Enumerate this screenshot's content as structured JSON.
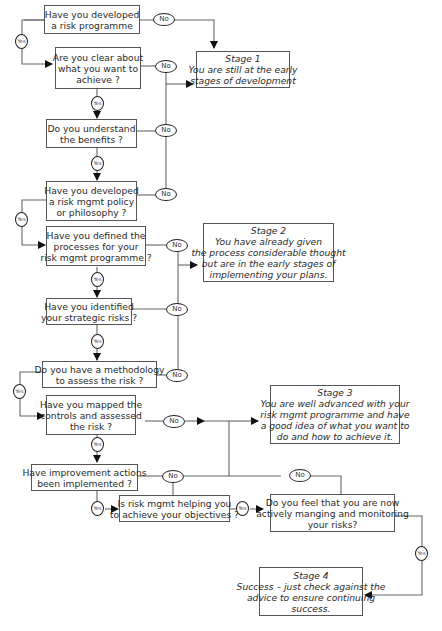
{
  "diagram": {
    "labels": {
      "yes": "Yes",
      "no": "No"
    },
    "questions": [
      {
        "id": "q1",
        "lines": [
          "Have you developed",
          "a risk programme"
        ]
      },
      {
        "id": "q2",
        "lines": [
          "Are you clear about",
          "what you want to",
          "achieve ?"
        ]
      },
      {
        "id": "q3",
        "lines": [
          "Do you understand",
          "the benefits ?"
        ]
      },
      {
        "id": "q4",
        "lines": [
          "Have you developed",
          "a risk mgmt policy",
          "or philosophy ?"
        ]
      },
      {
        "id": "q5",
        "lines": [
          "Have you defined the",
          "processes for your",
          "risk mgmt programme ?"
        ]
      },
      {
        "id": "q6",
        "lines": [
          "Have you identified",
          "your strategic risks ?"
        ]
      },
      {
        "id": "q7",
        "lines": [
          "Do you have a methodology",
          "to assess the risk ?"
        ]
      },
      {
        "id": "q8",
        "lines": [
          "Have you mapped the",
          "controls and assessed",
          "the risk ?"
        ]
      },
      {
        "id": "q9",
        "lines": [
          "Have improvement actions",
          "been implemented ?"
        ]
      },
      {
        "id": "q10",
        "lines": [
          "Is risk mgmt helping you",
          "to achieve your objectives ?"
        ]
      },
      {
        "id": "q11",
        "lines": [
          "Do you feel that you are now",
          "actively manging and monitoring",
          "your risks?"
        ]
      }
    ],
    "stages": [
      {
        "id": "s1",
        "lines": [
          "Stage 1",
          "You are still at the early",
          "stages of development"
        ]
      },
      {
        "id": "s2",
        "lines": [
          "Stage 2",
          "You have already given",
          "the process considerable thought",
          "but are in the early stages of",
          "implementing your plans."
        ]
      },
      {
        "id": "s3",
        "lines": [
          "Stage 3",
          "You are well advanced with your",
          "risk mgmt programme and have",
          "a good idea of what you want to",
          "do and how to achieve it."
        ]
      },
      {
        "id": "s4",
        "lines": [
          "Stage 4",
          "Success – just check against the",
          "advice to ensure continuing",
          "success."
        ]
      }
    ],
    "colors": {
      "line": "#555555",
      "border": "#555555",
      "text": "#2a2a2a",
      "background": "#ffffff"
    }
  }
}
